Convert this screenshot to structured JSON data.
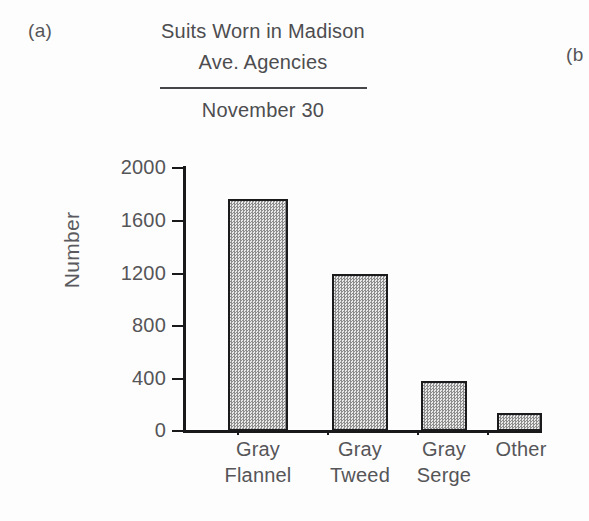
{
  "panel": {
    "left_letter": "(a)",
    "right_letter": "(b"
  },
  "title": {
    "line1": "Suits Worn in Madison",
    "line2": "Ave. Agencies",
    "subtitle": "November 30"
  },
  "axes": {
    "ylabel": "Number",
    "yticks": [
      "2000",
      "1600",
      "1200",
      "800",
      "400",
      "0"
    ]
  },
  "chart_data": {
    "type": "bar",
    "title": "Suits Worn in Madison Ave. Agencies",
    "subtitle": "November 30",
    "xlabel": "",
    "ylabel": "Number",
    "ylim": [
      0,
      2000
    ],
    "ytick_values": [
      0,
      400,
      800,
      1200,
      1600,
      2000
    ],
    "grid": false,
    "legend": "none",
    "categories": [
      "Gray Flannel",
      "Gray Tweed",
      "Gray Serge",
      "Other"
    ],
    "category_lines": [
      {
        "line1": "Gray",
        "line2": "Flannel"
      },
      {
        "line1": "Gray",
        "line2": "Tweed"
      },
      {
        "line1": "Gray",
        "line2": "Serge"
      },
      {
        "line1": "Other",
        "line2": ""
      }
    ],
    "values": [
      1760,
      1190,
      380,
      140
    ],
    "bar_fill": "#c4c4c4",
    "bar_edge": "#1b1b1d"
  }
}
